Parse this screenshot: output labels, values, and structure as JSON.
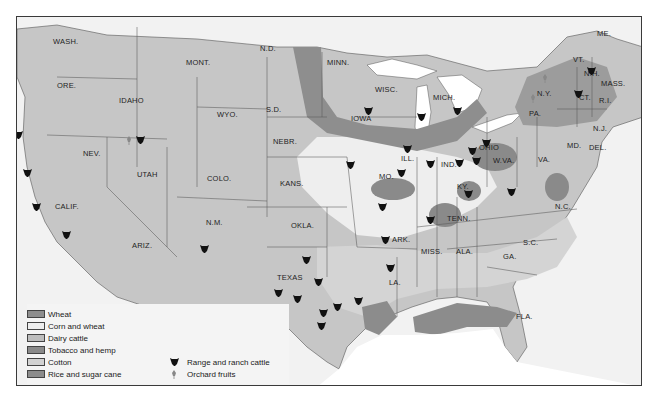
{
  "map": {
    "title": "U.S. agricultural regions",
    "colors": {
      "background": "#f2f2f2",
      "water": "#ffffff",
      "border": "#3a3a3a",
      "wheat": "#8e8e8e",
      "corn_and_wheat": "#eeeeee",
      "dairy_cattle": "#c4c4c4",
      "tobacco_and_hemp": "#8a8a8a",
      "cotton": "#d0d0d0",
      "rice_and_sugar_cane": "#8c8c8c",
      "range": "#cacaca"
    },
    "state_labels": [
      {
        "text": "WASH.",
        "x": 52,
        "y": 40
      },
      {
        "text": "ORE.",
        "x": 56,
        "y": 84
      },
      {
        "text": "IDAHO",
        "x": 118,
        "y": 99
      },
      {
        "text": "MONT.",
        "x": 185,
        "y": 61
      },
      {
        "text": "WYO.",
        "x": 216,
        "y": 113
      },
      {
        "text": "N.D.",
        "x": 259,
        "y": 47
      },
      {
        "text": "S.D.",
        "x": 265,
        "y": 108
      },
      {
        "text": "NEBR.",
        "x": 272,
        "y": 140
      },
      {
        "text": "MINN.",
        "x": 326,
        "y": 61
      },
      {
        "text": "WISC.",
        "x": 374,
        "y": 88
      },
      {
        "text": "IOWA",
        "x": 350,
        "y": 117
      },
      {
        "text": "MICH.",
        "x": 432,
        "y": 96
      },
      {
        "text": "ME.",
        "x": 596,
        "y": 32
      },
      {
        "text": "VT.",
        "x": 572,
        "y": 58
      },
      {
        "text": "N.H.",
        "x": 583,
        "y": 72
      },
      {
        "text": "MASS.",
        "x": 600,
        "y": 82
      },
      {
        "text": "N.Y.",
        "x": 536,
        "y": 92
      },
      {
        "text": "CT.",
        "x": 578,
        "y": 96
      },
      {
        "text": "R.I.",
        "x": 598,
        "y": 99
      },
      {
        "text": "PA.",
        "x": 528,
        "y": 112
      },
      {
        "text": "N.J.",
        "x": 592,
        "y": 127
      },
      {
        "text": "MD.",
        "x": 566,
        "y": 144
      },
      {
        "text": "DEL.",
        "x": 588,
        "y": 146
      },
      {
        "text": "NEV.",
        "x": 82,
        "y": 152
      },
      {
        "text": "UTAH",
        "x": 136,
        "y": 173
      },
      {
        "text": "COLO.",
        "x": 206,
        "y": 177
      },
      {
        "text": "KANS.",
        "x": 279,
        "y": 182
      },
      {
        "text": "MO.",
        "x": 378,
        "y": 175
      },
      {
        "text": "ILL.",
        "x": 400,
        "y": 157
      },
      {
        "text": "IND.",
        "x": 440,
        "y": 163
      },
      {
        "text": "OHIO",
        "x": 478,
        "y": 146
      },
      {
        "text": "W.VA.",
        "x": 492,
        "y": 159
      },
      {
        "text": "VA.",
        "x": 537,
        "y": 158
      },
      {
        "text": "KY.",
        "x": 456,
        "y": 185
      },
      {
        "text": "CALIF.",
        "x": 54,
        "y": 205
      },
      {
        "text": "N.M.",
        "x": 205,
        "y": 221
      },
      {
        "text": "OKLA.",
        "x": 290,
        "y": 224
      },
      {
        "text": "TENN.",
        "x": 446,
        "y": 217
      },
      {
        "text": "N.C.",
        "x": 554,
        "y": 205
      },
      {
        "text": "ARIZ.",
        "x": 131,
        "y": 244
      },
      {
        "text": "ARK.",
        "x": 391,
        "y": 238
      },
      {
        "text": "MISS.",
        "x": 420,
        "y": 250
      },
      {
        "text": "ALA.",
        "x": 455,
        "y": 250
      },
      {
        "text": "S.C.",
        "x": 522,
        "y": 241
      },
      {
        "text": "GA.",
        "x": 502,
        "y": 255
      },
      {
        "text": "TEXAS",
        "x": 276,
        "y": 276
      },
      {
        "text": "LA.",
        "x": 388,
        "y": 281
      },
      {
        "text": "FLA.",
        "x": 515,
        "y": 315
      }
    ],
    "cattle_markers": [
      {
        "x": 17,
        "y": 128
      },
      {
        "x": 26,
        "y": 166
      },
      {
        "x": 35,
        "y": 200
      },
      {
        "x": 65,
        "y": 228
      },
      {
        "x": 139,
        "y": 133
      },
      {
        "x": 203,
        "y": 242
      },
      {
        "x": 305,
        "y": 253
      },
      {
        "x": 296,
        "y": 292
      },
      {
        "x": 277,
        "y": 286
      },
      {
        "x": 317,
        "y": 275
      },
      {
        "x": 322,
        "y": 306
      },
      {
        "x": 320,
        "y": 319
      },
      {
        "x": 336,
        "y": 300
      },
      {
        "x": 357,
        "y": 294
      },
      {
        "x": 349,
        "y": 158
      },
      {
        "x": 381,
        "y": 200
      },
      {
        "x": 384,
        "y": 233
      },
      {
        "x": 389,
        "y": 261
      },
      {
        "x": 406,
        "y": 142
      },
      {
        "x": 367,
        "y": 104
      },
      {
        "x": 420,
        "y": 110
      },
      {
        "x": 467,
        "y": 187
      },
      {
        "x": 429,
        "y": 157
      },
      {
        "x": 458,
        "y": 156
      },
      {
        "x": 456,
        "y": 104
      },
      {
        "x": 475,
        "y": 154
      },
      {
        "x": 485,
        "y": 136
      },
      {
        "x": 471,
        "y": 144
      },
      {
        "x": 510,
        "y": 185
      },
      {
        "x": 429,
        "y": 213
      },
      {
        "x": 577,
        "y": 87
      },
      {
        "x": 590,
        "y": 64
      },
      {
        "x": 400,
        "y": 166
      }
    ],
    "orchard_markers": [
      {
        "x": 128,
        "y": 134
      },
      {
        "x": 544,
        "y": 72
      },
      {
        "x": 532,
        "y": 92
      }
    ]
  },
  "legend": {
    "items": [
      {
        "label": "Wheat",
        "swatch": "#8e8e8e"
      },
      {
        "label": "Corn and wheat",
        "swatch": "#eeeeee"
      },
      {
        "label": "Dairy cattle",
        "swatch": "#bdbdbd"
      },
      {
        "label": "Tobacco and hemp",
        "swatch": "#8a8a8a"
      },
      {
        "label": "Cotton",
        "swatch": "#d2d2d2"
      },
      {
        "label": "Rice and sugar cane",
        "swatch": "#8c8c8c"
      }
    ],
    "symbols": [
      {
        "label": "Range and ranch cattle",
        "icon": "cattle-head-icon"
      },
      {
        "label": "Orchard fruits",
        "icon": "fruit-tree-icon"
      }
    ]
  }
}
